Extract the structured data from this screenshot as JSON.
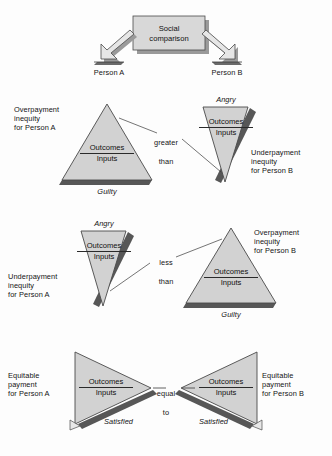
{
  "diagram": {
    "colors": {
      "background": "#fdfdfd",
      "shape_fill": "#d2d2d2",
      "shape_fill_light": "#dcdcdc",
      "shape_stroke": "#4a4a4a",
      "shadow_dark": "#575757",
      "shadow_mid": "#8f8f8f",
      "box_fill": "#d8d8d8",
      "text": "#141414",
      "connector": "#3a3a3a"
    },
    "source_box": {
      "line1": "Social",
      "line2": "comparison"
    },
    "branch_labels": {
      "left": "Person A",
      "right": "Person B"
    },
    "fraction": {
      "numerator": "Outcomes",
      "denominator": "Inputs"
    },
    "rows": [
      {
        "id": "row-greater-than",
        "connector": {
          "line1": "greater",
          "line2": "than"
        },
        "left": {
          "orientation": "up",
          "emotion": "Guilty",
          "emotion_position": "below",
          "description": "Overpayment\ninequity\nfor Person A",
          "description_position": "left"
        },
        "right": {
          "orientation": "down",
          "emotion": "Angry",
          "emotion_position": "above",
          "description": "Underpayment\ninequity\nfor Person B",
          "description_position": "right"
        }
      },
      {
        "id": "row-less-than",
        "connector": {
          "line1": "less",
          "line2": "than"
        },
        "left": {
          "orientation": "down",
          "emotion": "Angry",
          "emotion_position": "above",
          "description": "Underpayment\ninequity\nfor Person A",
          "description_position": "left"
        },
        "right": {
          "orientation": "up",
          "emotion": "Guilty",
          "emotion_position": "below",
          "description": "Overpayment\ninequity\nfor Person B",
          "description_position": "right"
        }
      },
      {
        "id": "row-equal-to",
        "connector": {
          "line1": "equal",
          "line2": "to"
        },
        "left": {
          "orientation": "right",
          "emotion": "Satisfied",
          "emotion_position": "below",
          "description": "Equitable\npayment\nfor Person A",
          "description_position": "left"
        },
        "right": {
          "orientation": "left",
          "emotion": "Satisfied",
          "emotion_position": "below",
          "description": "Equitable\npayment\nfor Person B",
          "description_position": "right"
        }
      }
    ]
  }
}
